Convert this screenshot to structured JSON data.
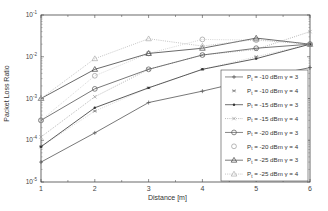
{
  "chart_data": {
    "type": "line",
    "title": "",
    "xlabel": "Distance [m]",
    "ylabel": "Packet Loss Ratio",
    "yscale": "log",
    "xlim": [
      1,
      6
    ],
    "ylim": [
      1e-05,
      0.1
    ],
    "x": [
      1,
      2,
      3,
      4,
      5,
      6
    ],
    "xticks": [
      "1",
      "2",
      "3",
      "4",
      "5",
      "6"
    ],
    "yticks": [
      "10^-5",
      "10^-4",
      "10^-3",
      "10^-2",
      "10^-1"
    ],
    "grid": false,
    "legend_position": "lower right",
    "series": [
      {
        "name": "P_t = -10 dBm γ = 3",
        "marker": "+",
        "linestyle": "solid",
        "values": [
          3e-05,
          0.00015,
          0.0008,
          0.0015,
          0.003,
          0.0055
        ]
      },
      {
        "name": "P_t = -10 dBm γ = 4",
        "marker": "*",
        "linestyle": "none",
        "values": [
          7e-05,
          0.0005,
          0.0018,
          0.005,
          0.01,
          0.02
        ]
      },
      {
        "name": "P_t = -15 dBm γ = 3",
        "marker": ".",
        "linestyle": "solid",
        "values": [
          7e-05,
          0.0006,
          0.0018,
          0.005,
          0.009,
          0.02
        ]
      },
      {
        "name": "P_t = -15 dBm γ = 4",
        "marker": "x",
        "linestyle": "dotted",
        "values": [
          0.00012,
          0.0011,
          0.005,
          0.011,
          0.015,
          0.04
        ]
      },
      {
        "name": "P_t = -20 dBm γ = 3",
        "marker": "o",
        "linestyle": "solid",
        "values": [
          0.0003,
          0.0017,
          0.005,
          0.011,
          0.016,
          0.02
        ]
      },
      {
        "name": "P_t = -20 dBm γ = 4",
        "marker": "o",
        "linestyle": "none",
        "values": [
          0.0003,
          0.0035,
          0.012,
          0.026,
          0.025,
          0.02
        ]
      },
      {
        "name": "P_t = -25 dBm γ = 3",
        "marker": "^",
        "linestyle": "solid",
        "values": [
          0.001,
          0.005,
          0.012,
          0.016,
          0.028,
          0.02
        ]
      },
      {
        "name": "P_t = -25 dBm γ = 4",
        "marker": "^",
        "linestyle": "dotted",
        "values": [
          0.001,
          0.009,
          0.027,
          0.018,
          0.026,
          0.02
        ]
      }
    ]
  },
  "axis": {
    "xlabel": "Distance [m]",
    "ylabel": "Packet Loss Ratio"
  }
}
